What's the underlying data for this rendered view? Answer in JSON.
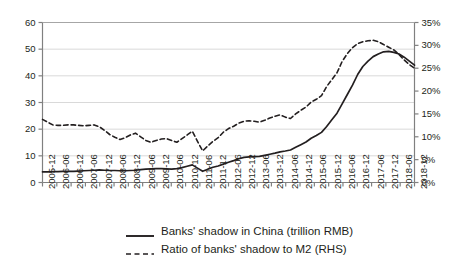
{
  "chart_data": {
    "type": "line",
    "title": "",
    "xlabel": "",
    "ylabel": "",
    "grid": true,
    "legend_position": "bottom",
    "x": [
      "2005-12",
      "2006-06",
      "2006-12",
      "2007-06",
      "2007-12",
      "2008-06",
      "2008-12",
      "2009-06",
      "2009-12",
      "2010-06",
      "2010-12",
      "2011-06",
      "2011-12",
      "2012-06",
      "2012-12",
      "2013-06",
      "2013-12",
      "2014-06",
      "2014-12",
      "2015-06",
      "2015-12",
      "2016-06",
      "2016-12",
      "2017-06",
      "2017-12",
      "2018-06",
      "2018-12"
    ],
    "tick_labels": [
      "2005-12",
      "2006-06",
      "2006-12",
      "2007-06",
      "2007-12",
      "2008-06",
      "2008-12",
      "2009-06",
      "2009-12",
      "2010-06",
      "2010-12",
      "2011-06",
      "2011-12",
      "2012-06",
      "2012-12",
      "2013-06",
      "2013-12",
      "2014-06",
      "2014-12",
      "2015-06",
      "2015-12",
      "2016-06",
      "2016-12",
      "2017-06",
      "2017-12",
      "2018-06",
      "2018-12"
    ],
    "axes": {
      "left": {
        "label": "",
        "ylim": [
          0,
          60
        ],
        "ticks": [
          0,
          10,
          20,
          30,
          40,
          50,
          60
        ],
        "tick_labels": [
          "0",
          "10",
          "20",
          "30",
          "40",
          "50",
          "60"
        ]
      },
      "right": {
        "label": "RHS",
        "ylim": [
          0,
          35
        ],
        "ticks": [
          0,
          5,
          10,
          15,
          20,
          25,
          30,
          35
        ],
        "tick_labels": [
          "0%",
          "5%",
          "10%",
          "15%",
          "20%",
          "25%",
          "30%",
          "35%"
        ]
      }
    },
    "series": [
      {
        "name": "Banks' shadow in China (trillion RMB)",
        "axis": "left",
        "style": "solid",
        "color": "#231f20",
        "values": [
          4.0,
          4.1,
          4.2,
          4.4,
          4.6,
          4.5,
          4.4,
          4.6,
          5.1,
          5.2,
          5.0,
          6.6,
          4.2,
          6.2,
          8.2,
          9.6,
          9.8,
          11.0,
          12.2,
          15.2,
          18.8,
          26.0,
          36.5,
          45.5,
          49.0,
          48.2,
          44.0
        ],
        "monthly_values": [
          4.0,
          4.0,
          4.1,
          4.1,
          4.2,
          4.2,
          4.2,
          4.3,
          4.4,
          4.5,
          4.6,
          4.7,
          4.6,
          4.5,
          4.5,
          4.4,
          4.4,
          4.5,
          4.6,
          4.8,
          5.0,
          5.1,
          5.2,
          5.2,
          5.1,
          5.0,
          5.2,
          5.6,
          6.1,
          6.6,
          5.4,
          4.2,
          5.0,
          5.7,
          6.2,
          6.9,
          7.6,
          8.2,
          8.9,
          9.4,
          9.6,
          9.7,
          9.8,
          10.2,
          10.6,
          11.0,
          11.5,
          11.8,
          12.2,
          13.2,
          14.2,
          15.2,
          16.6,
          17.6,
          18.8,
          21.0,
          23.5,
          26.0,
          29.5,
          33.0,
          36.5,
          40.5,
          43.5,
          45.5,
          47.2,
          48.2,
          49.0,
          49.2,
          48.8,
          48.2,
          47.0,
          45.5,
          44.0
        ]
      },
      {
        "name": "Ratio of banks' shadow to M2 (RHS)",
        "axis": "right",
        "style": "dashed",
        "color": "#231f20",
        "values": [
          13.8,
          12.5,
          12.6,
          12.4,
          12.6,
          10.5,
          9.4,
          10.8,
          8.8,
          9.6,
          8.8,
          11.2,
          6.9,
          9.8,
          12.3,
          13.5,
          13.2,
          14.5,
          14.0,
          16.5,
          19.0,
          24.0,
          29.5,
          31.0,
          30.2,
          28.0,
          25.0
        ],
        "monthly_values": [
          13.8,
          13.2,
          12.6,
          12.5,
          12.5,
          12.6,
          12.6,
          12.5,
          12.4,
          12.5,
          12.6,
          12.2,
          11.4,
          10.5,
          9.9,
          9.4,
          9.8,
          10.4,
          10.8,
          10.0,
          9.2,
          8.8,
          9.2,
          9.5,
          9.6,
          9.2,
          8.8,
          9.6,
          10.4,
          11.2,
          9.0,
          6.9,
          8.0,
          9.0,
          9.8,
          11.0,
          11.8,
          12.3,
          13.0,
          13.4,
          13.5,
          13.4,
          13.2,
          13.6,
          14.1,
          14.5,
          14.8,
          14.3,
          14.0,
          15.0,
          15.8,
          16.5,
          17.6,
          18.2,
          19.0,
          21.0,
          22.5,
          24.0,
          26.5,
          28.2,
          29.5,
          30.4,
          30.8,
          31.0,
          31.1,
          30.8,
          30.2,
          29.6,
          29.0,
          28.0,
          26.8,
          25.8,
          25.0
        ]
      }
    ]
  },
  "legend": {
    "items": [
      {
        "label": "Banks' shadow in China (trillion RMB)",
        "style": "solid"
      },
      {
        "label": "Ratio of banks' shadow to M2 (RHS)",
        "style": "dashed"
      }
    ]
  }
}
